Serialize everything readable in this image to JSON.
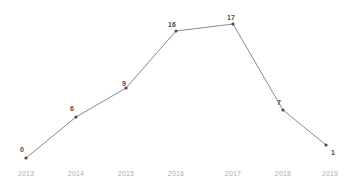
{
  "chart_data": {
    "type": "line",
    "title": "",
    "xlabel": "",
    "ylabel": "",
    "categories": [
      "2013",
      "2014",
      "2015",
      "2016",
      "2017",
      "2018",
      "2019"
    ],
    "values": [
      0,
      6,
      9,
      16,
      17,
      7,
      1
    ],
    "point_labels": [
      "0",
      "6",
      "9",
      "16",
      "17",
      "7",
      "1"
    ],
    "ylim": [
      0,
      18
    ],
    "grid": false,
    "axes_visible": false,
    "legend": false,
    "series": [
      {
        "name": "",
        "values": [
          0,
          6,
          9,
          16,
          17,
          7,
          1
        ]
      }
    ],
    "colors": {
      "line": "#8a8a8f",
      "marker": "#4a4a4f",
      "tick_label": "#adadb2",
      "point_label": "#4a4a4f",
      "background": "#ffffff"
    }
  },
  "axis": {
    "x_ticks": [
      {
        "label": "2013",
        "x": 26
      },
      {
        "label": "2014",
        "x": 76
      },
      {
        "label": "2015",
        "x": 126
      },
      {
        "label": "2016",
        "x": 176
      },
      {
        "label": "2017",
        "x": 233
      },
      {
        "label": "2018",
        "x": 283
      },
      {
        "label": "2019",
        "x": 330
      }
    ]
  },
  "points": [
    {
      "label": "0",
      "x": 26,
      "y": 158,
      "lx": 22,
      "ly": 149
    },
    {
      "label": "6",
      "x": 76,
      "y": 117,
      "lx": 72,
      "ly": 108
    },
    {
      "label": "9",
      "x": 126,
      "y": 88,
      "lx": 124,
      "ly": 83
    },
    {
      "label": "16",
      "x": 176,
      "y": 31,
      "lx": 172,
      "ly": 24
    },
    {
      "label": "17",
      "x": 233,
      "y": 24,
      "lx": 231,
      "ly": 17
    },
    {
      "label": "7",
      "x": 283,
      "y": 110,
      "lx": 279,
      "ly": 102
    },
    {
      "label": "1",
      "x": 326,
      "y": 145,
      "lx": 333,
      "ly": 152
    }
  ]
}
